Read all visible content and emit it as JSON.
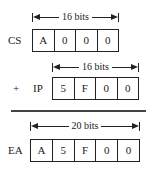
{
  "cs": {
    "label": "CS",
    "width_label": "16 bits",
    "digits": [
      "A",
      "0",
      "0",
      "0"
    ]
  },
  "ip": {
    "operator": "+",
    "label": "IP",
    "width_label": "16 bits",
    "digits": [
      "5",
      "F",
      "0",
      "0"
    ]
  },
  "ea": {
    "label": "EA",
    "width_label": "20 bits",
    "digits": [
      "A",
      "5",
      "F",
      "0",
      "0"
    ]
  }
}
